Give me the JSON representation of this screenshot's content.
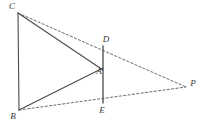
{
  "figure": {
    "background_color": "#ffffff",
    "width": 206,
    "height": 128,
    "solid_line_color": "#4a4a4a",
    "dashed_line_color": "#5a5a5a",
    "label_color": "#3a3a3a"
  },
  "points": {
    "C": {
      "label": "C",
      "x": 18,
      "y": 13,
      "label_x": 12,
      "label_y": 7
    },
    "B": {
      "label": "B",
      "x": 19,
      "y": 110,
      "label_x": 13,
      "label_y": 117
    },
    "D": {
      "label": "D",
      "x": 103,
      "y": 46,
      "label_x": 106,
      "label_y": 40
    },
    "A": {
      "label": "A",
      "x": 103,
      "y": 70,
      "label_x": 99,
      "label_y": 72
    },
    "E": {
      "label": "E",
      "x": 103,
      "y": 103,
      "label_x": 102,
      "label_y": 111
    },
    "P": {
      "label": "P",
      "x": 186,
      "y": 87,
      "label_x": 193,
      "label_y": 84
    }
  },
  "segments": {
    "solid": [
      {
        "name": "segment-CB",
        "from": "C",
        "to": "B",
        "x1": 18,
        "y1": 13,
        "x2": 19,
        "y2": 110
      },
      {
        "name": "segment-CA",
        "from": "C",
        "to": "A",
        "x1": 18,
        "y1": 13,
        "x2": 103,
        "y2": 70
      },
      {
        "name": "segment-BA",
        "from": "B",
        "to": "A",
        "x1": 19,
        "y1": 110,
        "x2": 103,
        "y2": 68
      },
      {
        "name": "segment-DE",
        "from": "D",
        "to": "E",
        "x1": 103,
        "y1": 46,
        "x2": 103,
        "y2": 103
      }
    ],
    "dashed": [
      {
        "name": "segment-CP",
        "from": "C",
        "to": "P",
        "x1": 18,
        "y1": 13,
        "x2": 186,
        "y2": 87
      },
      {
        "name": "segment-BP",
        "from": "B",
        "to": "P",
        "x1": 19,
        "y1": 110,
        "x2": 186,
        "y2": 87
      }
    ]
  },
  "vertex_order": [
    "C",
    "B",
    "D",
    "A",
    "E",
    "P"
  ]
}
